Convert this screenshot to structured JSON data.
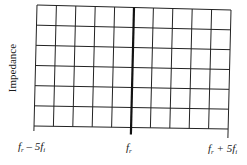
{
  "chart_data": {
    "type": "grid",
    "title": "",
    "ylabel": "Impedance",
    "xlabel": "",
    "x_tick_labels": [
      {
        "position": 0,
        "main": "f",
        "sub": "r",
        "rest": " – 5f",
        "rest_sub": "i"
      },
      {
        "position": 5,
        "main": "f",
        "sub": "r",
        "rest": "",
        "rest_sub": ""
      },
      {
        "position": 10,
        "main": "f",
        "sub": "r",
        "rest": " + 5f",
        "rest_sub": "i"
      }
    ],
    "x_divisions": 10,
    "y_divisions": 6,
    "center_line_emphasized": true,
    "grid": true,
    "series": []
  },
  "labels": {
    "ylabel": "Impedance",
    "left": {
      "f": "f",
      "r": "r",
      "op": " – 5f",
      "i": "i"
    },
    "center": {
      "f": "f",
      "r": "r"
    },
    "right": {
      "f": "f",
      "r": "r",
      "op": " + 5f",
      "i": "i"
    }
  },
  "colors": {
    "grid": "#222222",
    "center_line": "#111111",
    "text": "#1a1a1a"
  }
}
